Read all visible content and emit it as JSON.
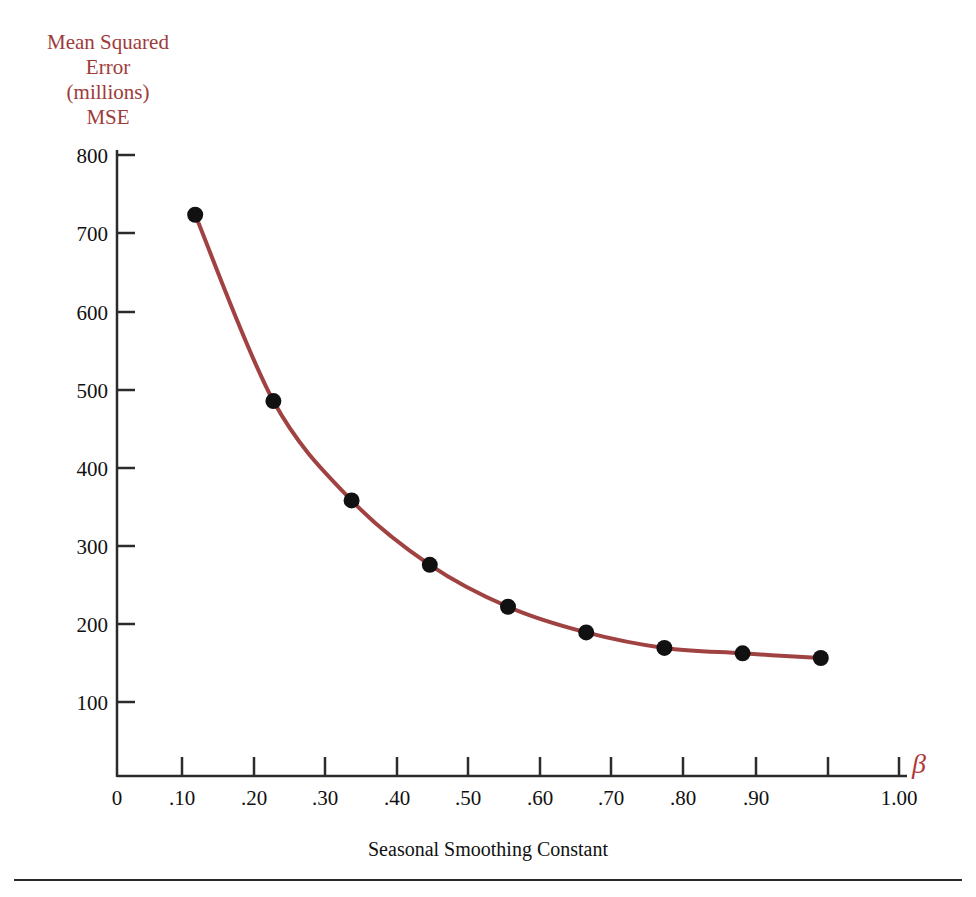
{
  "figure": {
    "y_axis_title": "Mean Squared\nError\n(millions)\nMSE",
    "x_axis_title": "Seasonal Smoothing Constant",
    "beta_symbol": "β",
    "colors": {
      "curve": "#a04242",
      "marker": "#111111",
      "axis": "#2b2b2b",
      "y_title": "#9e3b3b",
      "beta": "#b03a3a",
      "background": "#ffffff"
    }
  },
  "chart_data": {
    "type": "line",
    "title": "",
    "xlabel": "Seasonal Smoothing Constant",
    "ylabel": "Mean Squared Error (millions) MSE",
    "x": [
      0.1,
      0.2,
      0.3,
      0.4,
      0.5,
      0.6,
      0.7,
      0.8,
      0.9
    ],
    "values": [
      723,
      483,
      355,
      272,
      218,
      185,
      165,
      158,
      152
    ],
    "series": [
      {
        "name": "MSE",
        "values": [
          723,
          483,
          355,
          272,
          218,
          185,
          165,
          158,
          152
        ]
      }
    ],
    "xlim": [
      0,
      1.0
    ],
    "ylim": [
      0,
      800
    ],
    "xticks": [
      0,
      0.1,
      0.2,
      0.3,
      0.4,
      0.5,
      0.6,
      0.7,
      0.8,
      0.9,
      1.0
    ],
    "xtick_labels": [
      "0",
      ".10",
      ".20",
      ".30",
      ".40",
      ".50",
      ".60",
      ".70",
      ".80",
      ".90",
      "1.00"
    ],
    "yticks": [
      100,
      200,
      300,
      400,
      500,
      600,
      700,
      800
    ],
    "ytick_labels": [
      "100",
      "200",
      "300",
      "400",
      "500",
      "600",
      "700",
      "800"
    ],
    "grid": false,
    "legend": null,
    "markers": "filled-circle"
  }
}
